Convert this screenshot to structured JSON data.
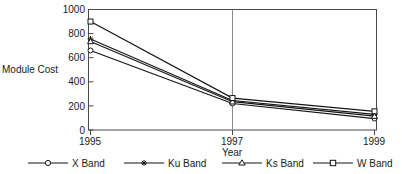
{
  "chart_data": {
    "type": "line",
    "title": "",
    "xlabel": "Year",
    "ylabel": "Module Cost",
    "x": [
      1995,
      1997,
      1999
    ],
    "xtick_labels": [
      "1995",
      "1997",
      "1999"
    ],
    "ytick_labels": [
      "0",
      "200",
      "400",
      "600",
      "800",
      "1000"
    ],
    "yticks": [
      0,
      200,
      400,
      600,
      800,
      1000
    ],
    "xlim": [
      1995,
      1999
    ],
    "ylim": [
      0,
      1000
    ],
    "grid": false,
    "legend_position": "bottom",
    "series": [
      {
        "name": "X Band",
        "marker": "circle",
        "values": [
          660,
          220,
          95
        ]
      },
      {
        "name": "Ku Band",
        "marker": "asterisk",
        "values": [
          755,
          245,
          130
        ]
      },
      {
        "name": "Ks Band",
        "marker": "triangle",
        "values": [
          735,
          235,
          115
        ]
      },
      {
        "name": "W Band",
        "marker": "square",
        "values": [
          900,
          265,
          155
        ]
      }
    ],
    "annotations": [
      {
        "type": "vertical-line",
        "x": 1997
      }
    ],
    "colors": {
      "line": "#151515",
      "frame": "#4a4a4a",
      "marker_fill": "#ffffff",
      "vertical_line": "#8a8a8a",
      "background": "#ffffff"
    }
  },
  "legend": {
    "entries": [
      {
        "label": "X Band",
        "marker": "circle"
      },
      {
        "label": "Ku Band",
        "marker": "asterisk"
      },
      {
        "label": "Ks Band",
        "marker": "triangle"
      },
      {
        "label": "W Band",
        "marker": "square"
      }
    ]
  },
  "axes": {
    "y_title": "Module Cost",
    "x_title": "Year"
  }
}
